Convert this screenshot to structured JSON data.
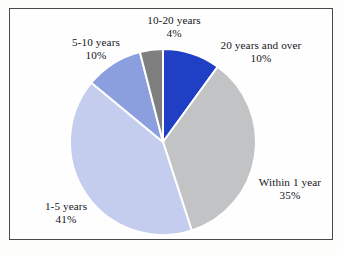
{
  "figure": {
    "background_color": "#fdfdfb",
    "frame_color": "#4a4a4a",
    "text_color": "#16161a",
    "separator_color": "#ffffff"
  },
  "chart_data": {
    "type": "pie",
    "title": "",
    "xlabel": "",
    "ylabel": "",
    "legend_position": "none",
    "grid": false,
    "start_angle_deg": 0,
    "direction": "clockwise",
    "categories": [
      "20 years and over",
      "Within 1 year",
      "1-5 years",
      "5-10 years",
      "10-20 years"
    ],
    "values": [
      10,
      35,
      41,
      10,
      4
    ],
    "value_unit": "%",
    "colors": [
      "#1f3fc4",
      "#c2c3c4",
      "#c4cdee",
      "#8b9ede",
      "#7f7f7f"
    ],
    "slices": [
      {
        "label": "20 years and over",
        "value": 10,
        "value_text": "10%",
        "color": "#1f3fc4",
        "start_deg": 0,
        "end_deg": 36
      },
      {
        "label": "Within 1 year",
        "value": 35,
        "value_text": "35%",
        "color": "#c2c3c4",
        "start_deg": 36,
        "end_deg": 162
      },
      {
        "label": "1-5 years",
        "value": 41,
        "value_text": "41%",
        "color": "#c4cdee",
        "start_deg": 162,
        "end_deg": 309.6
      },
      {
        "label": "5-10 years",
        "value": 10,
        "value_text": "10%",
        "color": "#8b9ede",
        "start_deg": 309.6,
        "end_deg": 345.6
      },
      {
        "label": "10-20 years",
        "value": 4,
        "value_text": "4%",
        "color": "#7f7f7f",
        "start_deg": 345.6,
        "end_deg": 360
      }
    ]
  },
  "labels": {
    "ten_twenty": {
      "name": "10-20 years",
      "pct": "4%"
    },
    "twenty_over": {
      "name": "20 years and over",
      "pct": "10%"
    },
    "five_ten": {
      "name": "5-10 years",
      "pct": "10%"
    },
    "one_five": {
      "name": "1-5 years",
      "pct": "41%"
    },
    "within_one": {
      "name": "Within 1 year",
      "pct": "35%"
    }
  }
}
